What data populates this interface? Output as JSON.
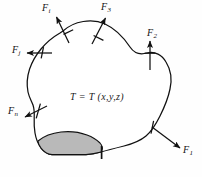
{
  "figure": {
    "kind": "free-body-force-diagram",
    "background_color": "#fefefe",
    "outline_color": "#111111",
    "shaded_region_fill": "#b9b9b9",
    "shaded_region_stroke": "#111111",
    "field_equation": "T = T (x,y,z)",
    "forces": [
      {
        "id": "f-i",
        "base": "F",
        "subscript": "i",
        "label": "F",
        "direction": "up-left",
        "position": {
          "left": 42,
          "top": 3
        }
      },
      {
        "id": "f-3",
        "base": "F",
        "subscript": "3",
        "label": "F",
        "direction": "up-right",
        "position": {
          "left": 101,
          "top": 2
        }
      },
      {
        "id": "f-2",
        "base": "F",
        "subscript": "2",
        "label": "F",
        "direction": "up",
        "position": {
          "left": 147,
          "top": 28
        }
      },
      {
        "id": "f-j",
        "base": "F",
        "subscript": "j",
        "label": "F",
        "direction": "left",
        "position": {
          "left": 12,
          "top": 45
        }
      },
      {
        "id": "f-n",
        "base": "F",
        "subscript": "n",
        "label": "F",
        "direction": "down-left",
        "position": {
          "left": 8,
          "top": 106
        }
      },
      {
        "id": "f-1",
        "base": "F",
        "subscript": "1",
        "label": "F",
        "direction": "down-right",
        "position": {
          "left": 183,
          "top": 145
        }
      }
    ]
  }
}
